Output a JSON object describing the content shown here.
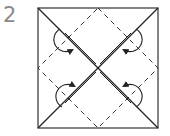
{
  "step": {
    "number": "2"
  },
  "diagram": {
    "type": "origami-fold-step",
    "square": {
      "x": 38,
      "y": 8,
      "size": 120
    },
    "elements": [
      "square-outline",
      "diagonal-folds",
      "dashed-diamond-creases",
      "four-curved-fold-arrows"
    ],
    "colors": {
      "line": "#222222",
      "step_number": "#8a8a8a"
    }
  }
}
